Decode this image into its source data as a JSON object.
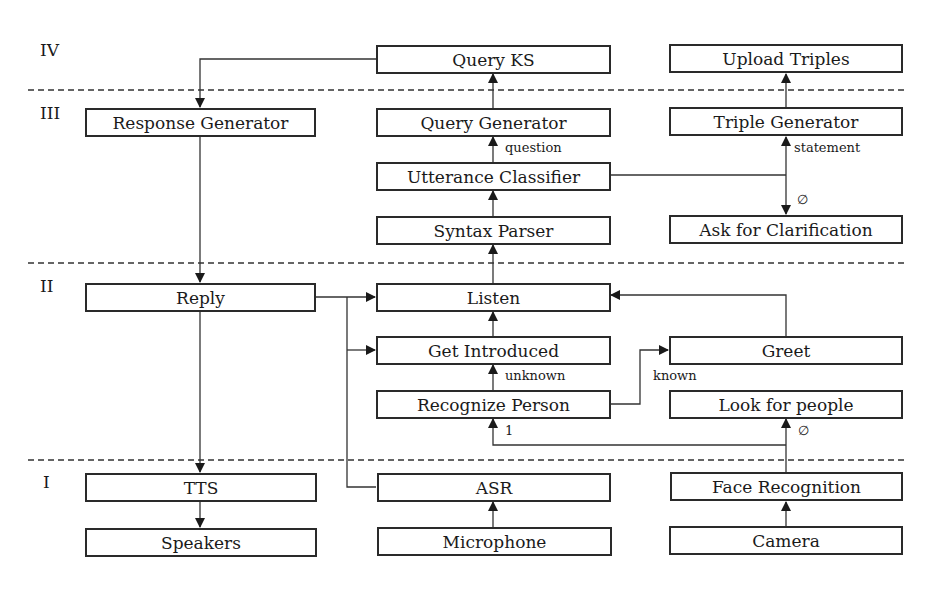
{
  "levels": [
    "IV",
    "III",
    "II",
    "I"
  ],
  "boxes": {
    "query_ks": "Query KS",
    "upload_triples": "Upload Triples",
    "response_generator": "Response Generator",
    "query_generator": "Query Generator",
    "triple_generator": "Triple Generator",
    "utterance_classifier": "Utterance Classifier",
    "syntax_parser": "Syntax Parser",
    "ask_for_clarification": "Ask for Clarification",
    "reply": "Reply",
    "listen": "Listen",
    "get_introduced": "Get Introduced",
    "greet": "Greet",
    "recognize_person": "Recognize Person",
    "look_for_people": "Look for people",
    "tts": "TTS",
    "asr": "ASR",
    "face_recognition": "Face Recognition",
    "speakers": "Speakers",
    "microphone": "Microphone",
    "camera": "Camera"
  },
  "edge_labels": {
    "question": "question",
    "statement": "statement",
    "empty_clarification": "∅",
    "unknown": "unknown",
    "known": "known",
    "one": "1",
    "empty_look": "∅"
  }
}
